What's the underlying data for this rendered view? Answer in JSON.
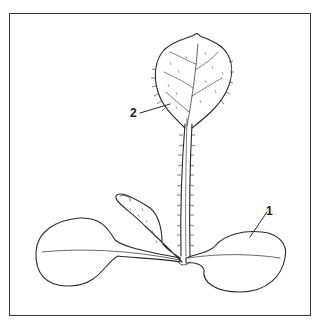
{
  "figure": {
    "type": "botanical line illustration",
    "frame_color": "#3a3a3a",
    "line_color": "#2a2a2a",
    "background": "#ffffff"
  },
  "labels": [
    {
      "id": "1",
      "text": "1",
      "points_to": "cotyledon (right seed leaf)"
    },
    {
      "id": "2",
      "text": "2",
      "points_to": "first true leaf (hairy, toothed blade)"
    }
  ]
}
